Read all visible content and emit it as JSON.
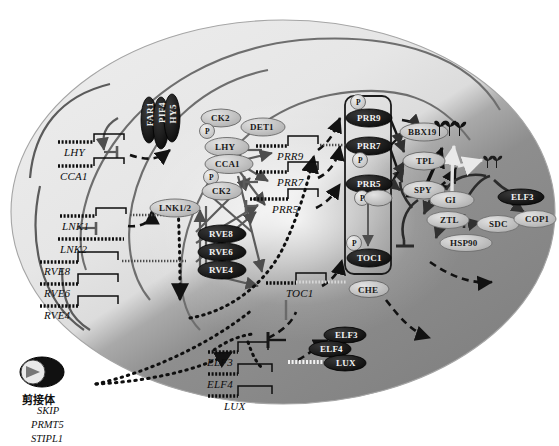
{
  "figure": {
    "type": "biological-pathway-diagram",
    "shading": {
      "day_region_color": "#e8e8e8",
      "night_region_color": "#8c8c8c",
      "outline_color": "#9a9a9a",
      "arrow_color_day": "#5a5a5a",
      "arrow_color_night": "#1a1a1a",
      "dashed_arrow_color": "#111111",
      "protein_fill_light": "#c9c9c9",
      "protein_fill_dark": "#141414",
      "gene_line_color": "#111111"
    }
  },
  "morning_genes": [
    {
      "id": "LHY",
      "label": "LHY",
      "x": 64,
      "y": 148
    },
    {
      "id": "CCA1",
      "label": "CCA1",
      "x": 62,
      "y": 172
    },
    {
      "id": "LNK1",
      "label": "LNK1",
      "x": 62,
      "y": 222
    },
    {
      "id": "LNK2",
      "label": "LNK2",
      "x": 62,
      "y": 245
    },
    {
      "id": "RVE8",
      "label": "RVE8",
      "x": 140,
      "y": 268
    },
    {
      "id": "RVE6",
      "label": "RVE6",
      "x": 140,
      "y": 290
    },
    {
      "id": "RVE4",
      "label": "RVE4",
      "x": 140,
      "y": 312
    }
  ],
  "central_genes": [
    {
      "id": "PRR9",
      "label": "PRR9",
      "x": 283,
      "y": 152
    },
    {
      "id": "PRR7",
      "label": "PRR7",
      "x": 283,
      "y": 180
    },
    {
      "id": "PRR5",
      "label": "PRR5",
      "x": 283,
      "y": 205
    },
    {
      "id": "TOC1",
      "label": "TOC1",
      "x": 291,
      "y": 289
    }
  ],
  "evening_genes": [
    {
      "id": "ELF3",
      "label": "ELF3",
      "x": 236,
      "y": 358
    },
    {
      "id": "ELF4",
      "label": "ELF4",
      "x": 236,
      "y": 381
    },
    {
      "id": "LUX",
      "label": "LUX",
      "x": 243,
      "y": 401
    }
  ],
  "light_input_proteins": [
    {
      "id": "FAR1",
      "label": "FAR1",
      "x": 149,
      "y": 104,
      "style": "dark-vertical"
    },
    {
      "id": "PIF4",
      "label": "PIF4",
      "x": 160,
      "y": 104,
      "style": "dark-vertical"
    },
    {
      "id": "HY5",
      "label": "HY5",
      "x": 171,
      "y": 104,
      "style": "dark-vertical"
    }
  ],
  "morning_proteins": [
    {
      "id": "CK2a",
      "label": "CK2",
      "x": 210,
      "y": 115,
      "fill": "light"
    },
    {
      "id": "LHYp",
      "label": "LHY",
      "x": 214,
      "y": 144,
      "fill": "light"
    },
    {
      "id": "CCA1p",
      "label": "CCA1",
      "x": 215,
      "y": 160,
      "fill": "light"
    },
    {
      "id": "CK2b",
      "label": "CK2",
      "x": 211,
      "y": 177,
      "fill": "light"
    },
    {
      "id": "DET1",
      "label": "DET1",
      "x": 250,
      "y": 123,
      "fill": "light"
    },
    {
      "id": "LNK12",
      "label": "LNK1/2",
      "x": 159,
      "y": 204,
      "fill": "light"
    },
    {
      "id": "RVE8p",
      "label": "RVE8",
      "x": 209,
      "y": 230,
      "fill": "dark"
    },
    {
      "id": "RVE6p",
      "label": "RVE6",
      "x": 209,
      "y": 248,
      "fill": "dark"
    },
    {
      "id": "RVE4p",
      "label": "RVE4",
      "x": 209,
      "y": 266,
      "fill": "dark"
    }
  ],
  "central_proteins": [
    {
      "id": "PRR9p",
      "label": "PRR9",
      "x": 366,
      "y": 114,
      "fill": "dark",
      "phos": "P",
      "phos_pos": "above"
    },
    {
      "id": "PRR7p",
      "label": "PRR7",
      "x": 366,
      "y": 142,
      "fill": "dark",
      "phos": "P",
      "phos_pos": "below"
    },
    {
      "id": "PRR5p",
      "label": "PRR5",
      "x": 366,
      "y": 180,
      "fill": "dark",
      "phos": "P",
      "phos_pos": "below"
    },
    {
      "id": "TOC1p",
      "label": "TOC1",
      "x": 366,
      "y": 254,
      "fill": "dark",
      "phos": "P",
      "phos_pos": "left"
    },
    {
      "id": "CHE",
      "label": "CHE",
      "x": 366,
      "y": 285,
      "fill": "light"
    }
  ],
  "corepressors": [
    {
      "id": "BBX19",
      "label": "BBX19",
      "x": 414,
      "y": 128,
      "fill": "light"
    },
    {
      "id": "TPL",
      "label": "TPL",
      "x": 416,
      "y": 157,
      "fill": "light"
    },
    {
      "id": "SPY",
      "label": "SPY",
      "x": 414,
      "y": 186,
      "fill": "light"
    }
  ],
  "evening_complex_proteins": [
    {
      "id": "ELF3p",
      "label": "ELF3",
      "x": 336,
      "y": 331,
      "fill": "dark"
    },
    {
      "id": "ELF4p",
      "label": "ELF4",
      "x": 322,
      "y": 345,
      "fill": "dark"
    },
    {
      "id": "LUXp",
      "label": "LUX",
      "x": 336,
      "y": 359,
      "fill": "dark"
    }
  ],
  "night_proteins": [
    {
      "id": "GI",
      "label": "GI",
      "x": 443,
      "y": 197,
      "fill": "light"
    },
    {
      "id": "ZTL",
      "label": "ZTL",
      "x": 438,
      "y": 216,
      "fill": "light"
    },
    {
      "id": "HSP90",
      "label": "HSP90",
      "x": 449,
      "y": 240,
      "fill": "light"
    },
    {
      "id": "SDC",
      "label": "SDC",
      "x": 489,
      "y": 221,
      "fill": "light"
    },
    {
      "id": "ELF3n",
      "label": "ELF3",
      "x": 512,
      "y": 195,
      "fill": "dark"
    },
    {
      "id": "COP1",
      "label": "COP1",
      "x": 527,
      "y": 216,
      "fill": "light"
    }
  ],
  "spliceosome": {
    "cn_label": "剪接体",
    "cn_x": 22,
    "cn_y": 393,
    "components": [
      {
        "label": "SKIP",
        "x": 36,
        "y": 406
      },
      {
        "label": "PRMT5",
        "x": 31,
        "y": 420
      },
      {
        "label": "STIPL1",
        "x": 31,
        "y": 434
      }
    ]
  },
  "icons": [
    {
      "name": "seedling-group-icon",
      "x": 437,
      "y": 122,
      "count": 3
    },
    {
      "name": "seedling-pair-icon",
      "x": 485,
      "y": 157,
      "count": 2
    }
  ],
  "legend_notes": {
    "arrow_solid": "activation / promotion",
    "arrow_bar": "repression / inhibition",
    "arrow_dashed": "protein production from transcript",
    "arrow_dotted": "post-transcriptional regulation"
  }
}
